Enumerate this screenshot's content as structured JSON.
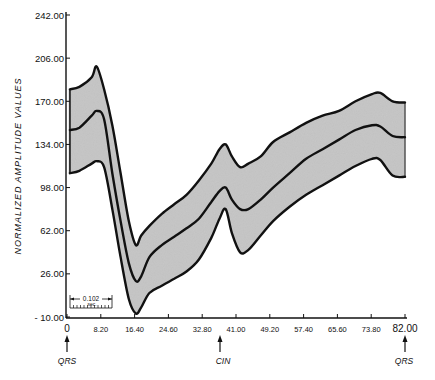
{
  "chart_data": {
    "type": "line",
    "title": "",
    "xlabel": "",
    "ylabel": "NORMALIZED AMPLITUDE VALUES",
    "xlim": [
      0,
      82
    ],
    "ylim": [
      -10,
      242
    ],
    "grid": false,
    "legend": null,
    "x_ticks": [
      "0",
      "8.20",
      "16.40",
      "24.60",
      "32.80",
      "41.00",
      "49.20",
      "57.40",
      "65.60",
      "73.80",
      "82.00"
    ],
    "x_tick_values": [
      0,
      8.2,
      16.4,
      24.6,
      32.8,
      41.0,
      49.2,
      57.4,
      65.6,
      73.8,
      82.0
    ],
    "y_ticks": [
      "242.00",
      "206.00",
      "170.00",
      "134.00",
      "98.00",
      "62.00",
      "26.00",
      "- 10.00"
    ],
    "y_tick_values": [
      242,
      206,
      170,
      134,
      98,
      62,
      26,
      -10
    ],
    "x": [
      0.7,
      3,
      6,
      7.2,
      9,
      11,
      13,
      15,
      16.7,
      18,
      20,
      23,
      26,
      29,
      32,
      35,
      37,
      38.5,
      40,
      42,
      44,
      47,
      50,
      54,
      58,
      62,
      66,
      70,
      74,
      76,
      79,
      82
    ],
    "series": [
      {
        "name": "upper envelope",
        "values": [
          180,
          182,
          190,
          199,
          180,
          150,
          110,
          70,
          50,
          58,
          66,
          76,
          84,
          92,
          104,
          118,
          130,
          134,
          124,
          115,
          118,
          124,
          136,
          144,
          152,
          158,
          162,
          170,
          176,
          177,
          170,
          169
        ]
      },
      {
        "name": "mean",
        "values": [
          146,
          148,
          158,
          162,
          155,
          110,
          70,
          35,
          20,
          24,
          40,
          50,
          57,
          64,
          72,
          86,
          95,
          98,
          88,
          80,
          80,
          88,
          98,
          110,
          122,
          130,
          138,
          146,
          150,
          149,
          141,
          140
        ]
      },
      {
        "name": "lower envelope",
        "values": [
          110,
          112,
          118,
          120,
          115,
          80,
          40,
          5,
          -7,
          -2,
          10,
          16,
          22,
          28,
          38,
          56,
          72,
          80,
          60,
          44,
          46,
          58,
          70,
          82,
          92,
          100,
          108,
          116,
          122,
          121,
          108,
          107
        ]
      }
    ],
    "annotations": [
      {
        "text": "QRS",
        "x": 0,
        "type": "arrow-below-axis"
      },
      {
        "text": "CIN",
        "x": 37,
        "type": "arrow-below-axis"
      },
      {
        "text": "QRS",
        "x": 82,
        "type": "arrow-below-axis"
      },
      {
        "text": "0.102 sec.",
        "type": "scale-bar"
      }
    ],
    "band_fill": "#c8c8c8"
  },
  "labels": {
    "y_axis_title": "NORMALIZED AMPLITUDE VALUES",
    "marker_qrs_start": "QRS",
    "marker_cin": "CIN",
    "marker_qrs_end": "QRS",
    "scale_bar_value": "0.102",
    "scale_bar_unit": "sec."
  }
}
